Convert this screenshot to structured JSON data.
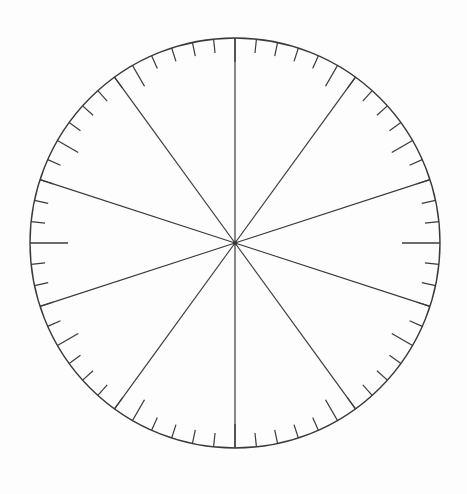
{
  "figure": {
    "name": "circular-protractor-wheel",
    "background_color": "#fdfdfd",
    "line_color": "#3a3a3a",
    "canvas": {
      "width": 467,
      "height": 494
    }
  },
  "chart_data": {
    "type": "pie",
    "title": "",
    "subtitle": "",
    "xlabel": "",
    "ylabel": "",
    "legend": [],
    "annotations": [],
    "grid": false,
    "labels_visible": false,
    "geometry": {
      "center_x": 235,
      "center_y": 243,
      "radius": 205,
      "rim_stroke_width": 1.4
    },
    "categories": [
      "sector-1",
      "sector-2",
      "sector-3",
      "sector-4",
      "sector-5",
      "sector-6",
      "sector-7",
      "sector-8",
      "sector-9",
      "sector-10"
    ],
    "values": [
      10,
      10,
      10,
      10,
      10,
      10,
      10,
      10,
      10,
      10
    ],
    "slice_angle_degrees": 36,
    "slice_count": 10,
    "diameter_line_count": 5,
    "spokes": {
      "count": 10,
      "angle_step_degrees": 36,
      "start_angle_degrees": 0,
      "stroke_width": 1.2,
      "angles_degrees": [
        0,
        36,
        72,
        108,
        144,
        180,
        216,
        252,
        288,
        324
      ]
    },
    "ticks": {
      "total_count": 60,
      "angle_step_degrees": 6,
      "minor": {
        "length": 14,
        "stroke_width": 1.2,
        "count": 48
      },
      "major": {
        "length": 24,
        "stroke_width": 1.3,
        "every_nth": 5,
        "angle_step_degrees": 30,
        "count": 12
      },
      "extra_long": {
        "length": 38,
        "stroke_width": 1.3,
        "angles_degrees": [
          90,
          270
        ],
        "count": 2
      }
    },
    "axis_ranges": {
      "angle_min_degrees": 0,
      "angle_max_degrees": 360
    }
  }
}
